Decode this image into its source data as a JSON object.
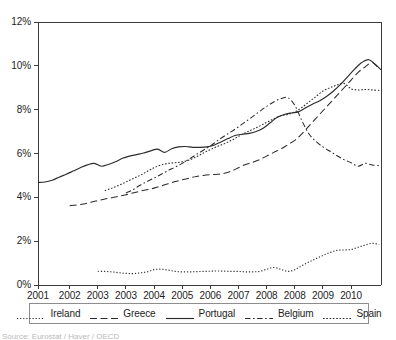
{
  "chart_data": {
    "type": "line",
    "title": "",
    "xlabel": "",
    "ylabel": "",
    "xlim": [
      2001.0,
      2010.75
    ],
    "ylim": [
      0,
      12
    ],
    "grid": false,
    "legend_position": "bottom",
    "y_tick_labels": [
      "0%",
      "2%",
      "4%",
      "6%",
      "8%",
      "10%",
      "12%"
    ],
    "y_tick_values": [
      0,
      2,
      4,
      6,
      8,
      10,
      12
    ],
    "x_tick_labels": [
      "2001",
      "2002",
      "2003",
      "2003",
      "2004",
      "2005",
      "2006",
      "2007",
      "2008",
      "2008",
      "2009",
      "2010"
    ],
    "x_tick_values": [
      2001.0,
      2001.9,
      2002.7,
      2003.5,
      2004.3,
      2005.1,
      2005.9,
      2006.7,
      2007.5,
      2008.3,
      2009.1,
      2009.9
    ],
    "series": [
      {
        "name": "Ireland",
        "style": "dotted",
        "x": [
          2002.7,
          2002.9,
          2003.1,
          2003.3,
          2003.5,
          2003.7,
          2003.9,
          2004.1,
          2004.3,
          2004.5,
          2004.7,
          2004.9,
          2005.1,
          2005.3,
          2005.5,
          2005.7,
          2005.9,
          2006.1,
          2006.3,
          2006.5,
          2006.7,
          2006.9,
          2007.1,
          2007.3,
          2007.5,
          2007.7,
          2007.9,
          2008.1,
          2008.3,
          2008.5,
          2008.7,
          2008.9,
          2009.1,
          2009.3,
          2009.5,
          2009.7,
          2009.9,
          2010.1,
          2010.3,
          2010.5,
          2010.7
        ],
        "y": [
          0.62,
          0.62,
          0.6,
          0.56,
          0.53,
          0.52,
          0.55,
          0.6,
          0.7,
          0.72,
          0.68,
          0.62,
          0.6,
          0.6,
          0.61,
          0.62,
          0.63,
          0.64,
          0.63,
          0.62,
          0.62,
          0.6,
          0.6,
          0.62,
          0.72,
          0.8,
          0.72,
          0.62,
          0.7,
          0.88,
          1.05,
          1.2,
          1.35,
          1.48,
          1.58,
          1.6,
          1.62,
          1.72,
          1.82,
          1.9,
          1.85
        ]
      },
      {
        "name": "Greece",
        "style": "dashed",
        "x": [
          2001.9,
          2002.1,
          2002.3,
          2002.5,
          2002.7,
          2002.9,
          2003.1,
          2003.3,
          2003.5,
          2003.7,
          2003.9,
          2004.1,
          2004.3,
          2004.5,
          2004.7,
          2004.9,
          2005.1,
          2005.3,
          2005.5,
          2005.7,
          2005.9,
          2006.1,
          2006.3,
          2006.5,
          2006.7,
          2006.9,
          2007.1,
          2007.3,
          2007.5,
          2007.7,
          2007.9,
          2008.1,
          2008.3,
          2008.5,
          2008.7,
          2008.9,
          2009.1,
          2009.3,
          2009.5,
          2009.7,
          2009.9,
          2010.1,
          2010.3,
          2010.5,
          2010.7
        ],
        "y": [
          3.62,
          3.65,
          3.7,
          3.78,
          3.85,
          3.92,
          3.98,
          4.05,
          4.12,
          4.2,
          4.28,
          4.35,
          4.42,
          4.52,
          4.62,
          4.72,
          4.8,
          4.88,
          4.95,
          5.0,
          5.03,
          5.05,
          5.1,
          5.2,
          5.35,
          5.5,
          5.6,
          5.72,
          5.88,
          6.05,
          6.2,
          6.4,
          6.6,
          6.9,
          7.25,
          7.6,
          7.95,
          8.3,
          8.65,
          9.0,
          9.35,
          9.7,
          9.95,
          10.15,
          9.85
        ]
      },
      {
        "name": "Portugal",
        "style": "solid",
        "x": [
          2001.0,
          2001.2,
          2001.4,
          2001.6,
          2001.8,
          2002.0,
          2002.2,
          2002.4,
          2002.6,
          2002.8,
          2003.0,
          2003.2,
          2003.4,
          2003.6,
          2003.8,
          2004.0,
          2004.2,
          2004.4,
          2004.6,
          2004.8,
          2005.0,
          2005.2,
          2005.4,
          2005.6,
          2005.8,
          2006.0,
          2006.2,
          2006.4,
          2006.6,
          2006.8,
          2007.0,
          2007.2,
          2007.4,
          2007.6,
          2007.8,
          2008.0,
          2008.2,
          2008.4,
          2008.6,
          2008.8,
          2009.0,
          2009.2,
          2009.4,
          2009.6,
          2009.8,
          2010.0,
          2010.2,
          2010.4,
          2010.6,
          2010.75
        ],
        "y": [
          4.68,
          4.7,
          4.78,
          4.92,
          5.05,
          5.2,
          5.35,
          5.48,
          5.55,
          5.42,
          5.5,
          5.62,
          5.78,
          5.88,
          5.95,
          6.02,
          6.12,
          6.2,
          6.05,
          6.22,
          6.3,
          6.32,
          6.28,
          6.28,
          6.3,
          6.38,
          6.52,
          6.68,
          6.82,
          6.88,
          6.92,
          7.0,
          7.15,
          7.4,
          7.65,
          7.78,
          7.85,
          7.9,
          8.08,
          8.25,
          8.4,
          8.6,
          8.85,
          9.15,
          9.5,
          9.85,
          10.15,
          10.28,
          10.05,
          9.82
        ]
      },
      {
        "name": "Belgium",
        "style": "dashdot",
        "x": [
          2003.5,
          2003.7,
          2003.9,
          2004.1,
          2004.3,
          2004.5,
          2004.7,
          2004.9,
          2005.1,
          2005.3,
          2005.5,
          2005.7,
          2005.9,
          2006.1,
          2006.3,
          2006.5,
          2006.7,
          2006.9,
          2007.1,
          2007.3,
          2007.5,
          2007.7,
          2007.9,
          2008.1,
          2008.3,
          2008.5,
          2008.7,
          2008.9,
          2009.1,
          2009.3,
          2009.5,
          2009.7,
          2009.9,
          2010.1,
          2010.3,
          2010.5,
          2010.7
        ],
        "y": [
          4.2,
          4.35,
          4.55,
          4.72,
          4.88,
          5.05,
          5.22,
          5.38,
          5.55,
          5.75,
          5.95,
          6.15,
          6.35,
          6.58,
          6.8,
          7.0,
          7.22,
          7.45,
          7.68,
          7.92,
          8.15,
          8.35,
          8.5,
          8.55,
          8.2,
          7.5,
          6.9,
          6.55,
          6.3,
          6.1,
          5.9,
          5.72,
          5.58,
          5.42,
          5.55,
          5.48,
          5.45
        ]
      },
      {
        "name": "Spain",
        "style": "finedot",
        "x": [
          2002.9,
          2003.1,
          2003.3,
          2003.5,
          2003.7,
          2003.9,
          2004.1,
          2004.3,
          2004.5,
          2004.7,
          2004.9,
          2005.1,
          2005.3,
          2005.5,
          2005.7,
          2005.9,
          2006.1,
          2006.3,
          2006.5,
          2006.7,
          2006.9,
          2007.1,
          2007.3,
          2007.5,
          2007.7,
          2007.9,
          2008.1,
          2008.3,
          2008.5,
          2008.7,
          2008.9,
          2009.1,
          2009.3,
          2009.5,
          2009.7,
          2009.9,
          2010.1,
          2010.3,
          2010.5,
          2010.7
        ],
        "y": [
          4.3,
          4.42,
          4.55,
          4.7,
          4.85,
          5.0,
          5.18,
          5.35,
          5.48,
          5.55,
          5.58,
          5.62,
          5.7,
          5.85,
          6.02,
          6.18,
          6.32,
          6.45,
          6.6,
          6.78,
          6.95,
          7.1,
          7.25,
          7.42,
          7.58,
          7.72,
          7.78,
          7.9,
          8.1,
          8.35,
          8.6,
          8.85,
          9.0,
          9.12,
          9.2,
          8.95,
          8.9,
          8.92,
          8.9,
          8.88
        ]
      }
    ]
  },
  "legend": {
    "entries": [
      {
        "label": "Ireland",
        "style": "dotted"
      },
      {
        "label": "Greece",
        "style": "dashed"
      },
      {
        "label": "Portugal",
        "style": "solid"
      },
      {
        "label": "Belgium",
        "style": "dashdot"
      },
      {
        "label": "Spain",
        "style": "finedot"
      }
    ]
  },
  "footnote": {
    "text": "Source: Eurostat / Haver / OECD"
  },
  "colors": {
    "line": "#2b2b2b",
    "axis": "#3a3a3a",
    "text": "#1d1d1d"
  }
}
